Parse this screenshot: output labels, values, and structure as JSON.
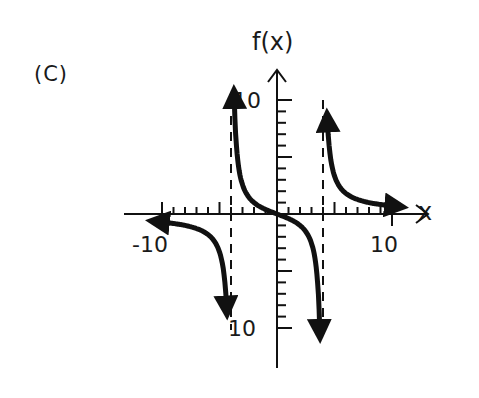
{
  "panel_label": "(C)",
  "chart_data": {
    "type": "line",
    "title": "(C)",
    "xlabel": "x",
    "ylabel": "f(x)",
    "xlim": [
      -10,
      10
    ],
    "ylim": [
      -10,
      10
    ],
    "x_tick_labels": [
      "-10",
      "10"
    ],
    "y_tick_labels": [
      "10",
      "10"
    ],
    "tick_step": 1,
    "grid": false,
    "legend": null,
    "vertical_asymptotes": [
      -4,
      4
    ],
    "asymptote_style": "dashed",
    "branches": [
      {
        "name": "left",
        "x_range": [
          -10,
          -4
        ],
        "behavior": "from y≈0- at x=-10 decreasing to -infinity as x->-4-",
        "arrows": [
          "left end (-10, ~0)",
          "down"
        ]
      },
      {
        "name": "middle",
        "x_range": [
          -4,
          4
        ],
        "behavior": "from +infinity at x->-4+ decreasing through (0,0) to -infinity as x->4-",
        "arrows": [
          "up",
          "down"
        ]
      },
      {
        "name": "right",
        "x_range": [
          4,
          10
        ],
        "behavior": "from +infinity at x->4+ decreasing to y≈0+ at x=10",
        "arrows": [
          "up",
          "right end (10, ~0)"
        ]
      }
    ]
  },
  "labels": {
    "ylabel": "f(x)",
    "xlabel": "x",
    "y_top": "10",
    "y_bottom": "10",
    "x_left": "-10",
    "x_right": "10"
  }
}
